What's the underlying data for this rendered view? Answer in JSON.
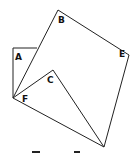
{
  "diagram": {
    "type": "geometry-figure",
    "labels": {
      "A": "A",
      "B": "B",
      "C": "C",
      "E": "E",
      "F": "F"
    },
    "vertices": {
      "A": [
        13,
        48
      ],
      "A_top_end": [
        37,
        48
      ],
      "B": [
        58,
        10
      ],
      "E": [
        129,
        55
      ],
      "G": [
        104,
        147
      ],
      "F": [
        13,
        98
      ],
      "C": [
        53,
        70
      ]
    },
    "colors": {
      "stroke": "#222222",
      "background": "#ffffff"
    }
  }
}
